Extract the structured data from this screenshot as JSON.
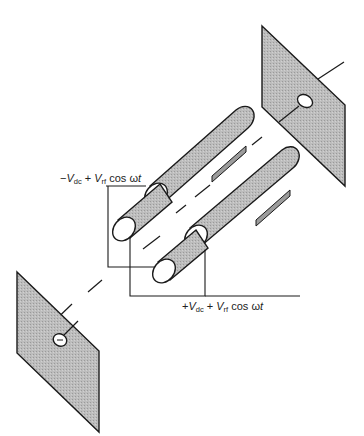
{
  "diagram": {
    "colors": {
      "fill": "#b8b8b8",
      "stroke": "#1a1a1a",
      "background": "#ffffff"
    },
    "labels": {
      "top": {
        "sign": "−",
        "v1": "V",
        "sub1": "dc",
        "plus": " + ",
        "v2": "V",
        "sub2": "rf",
        "cos": " cos ω",
        "t": "t"
      },
      "bottom": {
        "sign": "+",
        "v1": "V",
        "sub1": "dc",
        "plus": " + ",
        "v2": "V",
        "sub2": "rf",
        "cos": " cos ω",
        "t": "t"
      }
    },
    "components": [
      "entrance-aperture-plate",
      "quadrupole-rod-upper-left",
      "quadrupole-rod-lower-left",
      "quadrupole-rod-upper-right",
      "quadrupole-rod-lower-right",
      "exit-aperture-plate",
      "ion-optical-axis"
    ]
  }
}
